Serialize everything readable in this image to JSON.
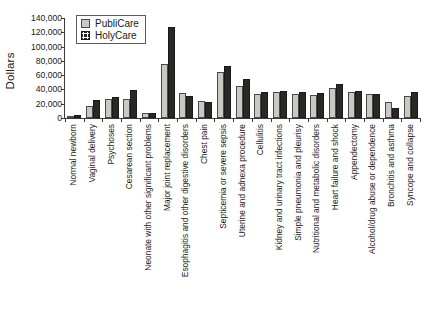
{
  "chart_data": {
    "type": "bar",
    "title": "",
    "xlabel": "",
    "ylabel": "Dollars",
    "ylim": [
      0,
      140000
    ],
    "ytick_step": 20000,
    "yticks": [
      "0",
      "20,000",
      "40,000",
      "60,000",
      "80,000",
      "100,000",
      "120,000",
      "140,000"
    ],
    "ytick_values": [
      0,
      20000,
      40000,
      60000,
      80000,
      100000,
      120000,
      140000
    ],
    "grid": false,
    "legend_position": "upper-left",
    "orientation": "vertical",
    "categories": [
      "Normal newborn",
      "Vaginal delivery",
      "Psychoses",
      "Cesarean section",
      "Neonate with other significant problems",
      "Major joint replacement",
      "Esophagitis and other digestive disorders",
      "Chest pain",
      "Septicemia or severe sepsis",
      "Uterine and adnexa procedure",
      "Cellulitis",
      "Kidney and urinary tract infections",
      "Simple pneumonia and pleurisy",
      "Nutritional and metabolic disorders",
      "Heart failure and shock",
      "Appendectomy",
      "Alcohol/drug abuse or dependence",
      "Bronchitis and asthma",
      "Syncope and collapse"
    ],
    "series": [
      {
        "name": "PubliCare",
        "color": "#c9c9c4",
        "values": [
          3000,
          17000,
          27000,
          27000,
          6500,
          75000,
          35000,
          24000,
          65000,
          45000,
          33000,
          36000,
          34000,
          32000,
          42000,
          36000,
          33000,
          22000,
          31000
        ]
      },
      {
        "name": "HolyCare",
        "color": "#2a2724",
        "values": [
          4000,
          25000,
          30000,
          39000,
          7500,
          128000,
          31000,
          23000,
          73000,
          54000,
          36000,
          38000,
          36000,
          35000,
          48000,
          38000,
          34000,
          14000,
          36000
        ]
      }
    ]
  },
  "legend": {
    "items": [
      {
        "label": "PubliCare",
        "key": "publicare"
      },
      {
        "label": "HolyCare",
        "key": "holycare"
      }
    ]
  }
}
